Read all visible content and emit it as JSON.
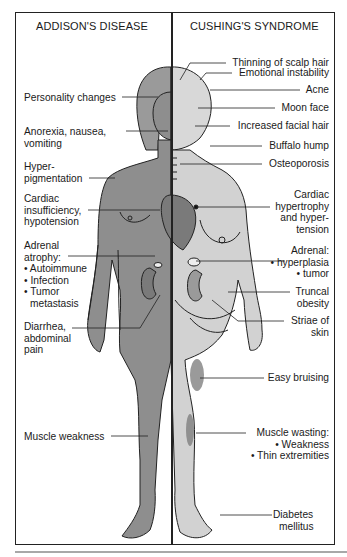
{
  "headers": {
    "left": "ADDISON'S DISEASE",
    "right": "CUSHING'S SYNDROME"
  },
  "colors": {
    "border": "#222222",
    "addison_skin": "#8e8e8e",
    "cushing_skin": "#d2d2d2",
    "bruise": "#9a9a9a",
    "rule": "#a8a8a8"
  },
  "addison_labels": [
    {
      "lines": [
        "Personality changes"
      ]
    },
    {
      "lines": [
        "Anorexia, nausea,",
        "vomiting"
      ]
    },
    {
      "lines": [
        "Hyper-",
        "pigmentation"
      ]
    },
    {
      "lines": [
        "Cardiac",
        "insufficiency,",
        "hypotension"
      ]
    },
    {
      "lines": [
        "Adrenal",
        "atrophy:",
        "• Autoimmune",
        "• Infection",
        "• Tumor",
        "   metastasis"
      ]
    },
    {
      "lines": [
        "Diarrhea,",
        "abdominal",
        "pain"
      ]
    },
    {
      "lines": [
        "Muscle weakness"
      ]
    }
  ],
  "cushing_labels": [
    {
      "lines": [
        "Thinning of scalp hair"
      ]
    },
    {
      "lines": [
        "Emotional instability"
      ]
    },
    {
      "lines": [
        "Acne"
      ]
    },
    {
      "lines": [
        "Moon face"
      ]
    },
    {
      "lines": [
        "Increased facial hair"
      ]
    },
    {
      "lines": [
        "Buffalo hump"
      ]
    },
    {
      "lines": [
        "Osteoporosis"
      ]
    },
    {
      "lines": [
        "Cardiac",
        "hypertrophy",
        "and hyper-",
        "tension"
      ]
    },
    {
      "lines": [
        "Adrenal:",
        "• hyperplasia",
        "• tumor"
      ]
    },
    {
      "lines": [
        "Truncal",
        "obesity"
      ]
    },
    {
      "lines": [
        "Striae of",
        "skin"
      ]
    },
    {
      "lines": [
        "Easy bruising"
      ]
    },
    {
      "lines": [
        "Muscle wasting:",
        "• Weakness",
        "• Thin extremities"
      ]
    },
    {
      "lines": [
        "Diabetes",
        "mellitus"
      ]
    }
  ]
}
